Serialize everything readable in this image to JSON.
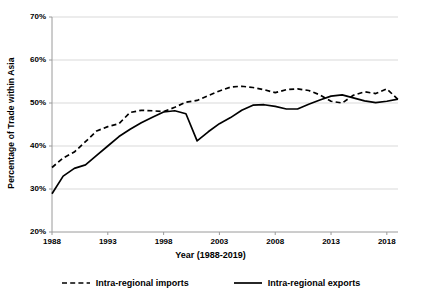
{
  "chart_data": {
    "type": "line",
    "title": "",
    "xlabel": "Year (1988-2019)",
    "ylabel": "Percentage of Trade within Asia",
    "xlim": [
      1988,
      2019
    ],
    "ylim": [
      20,
      70
    ],
    "yticks": [
      "20%",
      "30%",
      "40%",
      "50%",
      "60%",
      "70%"
    ],
    "ytick_values": [
      20,
      30,
      40,
      50,
      60,
      70
    ],
    "xticks": [
      "1988",
      "1993",
      "1998",
      "2003",
      "2008",
      "2013",
      "2018"
    ],
    "xtick_values": [
      1988,
      1993,
      1998,
      2003,
      2008,
      2013,
      2018
    ],
    "grid": "horizontal",
    "legend_position": "bottom",
    "x": [
      1988,
      1989,
      1990,
      1991,
      1992,
      1993,
      1994,
      1995,
      1996,
      1997,
      1998,
      1999,
      2000,
      2001,
      2002,
      2003,
      2004,
      2005,
      2006,
      2007,
      2008,
      2009,
      2010,
      2011,
      2012,
      2013,
      2014,
      2015,
      2016,
      2017,
      2018,
      2019
    ],
    "series": [
      {
        "name": "Intra-regional imports",
        "style": "dashed",
        "color": "#000000",
        "values": [
          35.0,
          37.2,
          38.6,
          41.0,
          43.5,
          44.5,
          45.2,
          47.8,
          48.3,
          48.2,
          48.0,
          49.0,
          50.2,
          50.6,
          51.7,
          52.8,
          53.7,
          53.9,
          53.6,
          53.1,
          52.4,
          53.1,
          53.3,
          52.9,
          51.9,
          50.4,
          50.0,
          51.8,
          52.6,
          52.2,
          53.3,
          50.8
        ]
      },
      {
        "name": "Intra-regional exports",
        "style": "solid",
        "color": "#000000",
        "values": [
          28.9,
          33.0,
          34.8,
          35.6,
          37.8,
          40.0,
          42.2,
          43.9,
          45.4,
          46.7,
          47.9,
          48.2,
          47.5,
          41.2,
          43.3,
          45.2,
          46.6,
          48.3,
          49.5,
          49.6,
          49.2,
          48.6,
          48.6,
          49.7,
          50.7,
          51.6,
          51.9,
          51.2,
          50.5,
          50.1,
          50.4,
          50.9
        ]
      }
    ]
  },
  "legend": {
    "items": [
      {
        "label": "Intra-regional imports",
        "style": "dashed"
      },
      {
        "label": "Intra-regional exports",
        "style": "solid"
      }
    ]
  },
  "axes": {
    "y_title": "Percentage of Trade within Asia",
    "x_title": "Year (1988-2019)"
  }
}
